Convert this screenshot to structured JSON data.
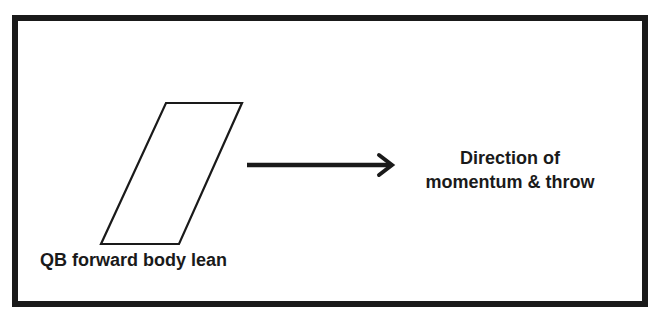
{
  "diagram": {
    "colors": {
      "ink": "#1a1a1a",
      "background": "#ffffff"
    },
    "frame": {
      "shape": "rectangle",
      "border_width": 6.5
    },
    "body_shape": {
      "shape": "parallelogram",
      "semantic": "qb-body-icon",
      "points": [
        [
          166,
          103
        ],
        [
          242,
          103
        ],
        [
          179,
          244
        ],
        [
          101,
          244
        ]
      ]
    },
    "arrow": {
      "semantic": "arrow-right-icon",
      "from": [
        247,
        165
      ],
      "to": [
        393,
        165
      ]
    },
    "labels": {
      "body_lean": "QB forward body lean",
      "direction_line1": "Direction of",
      "direction_line2": "momentum & throw"
    }
  }
}
